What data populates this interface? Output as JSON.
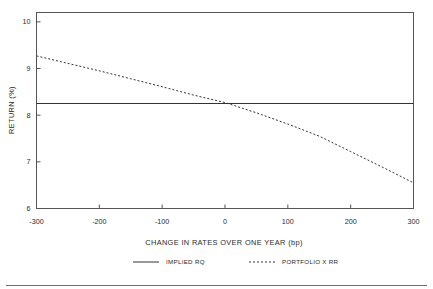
{
  "chart_data": {
    "type": "line",
    "title": "",
    "xlabel": "CHANGE IN RATES OVER ONE YEAR (bp)",
    "ylabel": "RETURN (%)",
    "xlim": [
      -300,
      300
    ],
    "ylim": [
      6,
      10.2
    ],
    "grid": false,
    "legend_position": "below-plot-center",
    "xticks": [
      -300,
      -200,
      -100,
      0,
      100,
      200,
      300
    ],
    "xtick_labels": [
      "-300",
      "-200",
      "-100",
      "0",
      "100",
      "200",
      "300"
    ],
    "yticks": [
      6,
      7,
      8,
      9,
      10
    ],
    "ytick_labels": [
      "6",
      "7",
      "8",
      "9",
      "10"
    ],
    "series": [
      {
        "name": "IMPLIED RQ",
        "style": "solid",
        "color": "#333333",
        "x": [
          -300,
          300
        ],
        "values": [
          8.25,
          8.25
        ]
      },
      {
        "name": "PORTFOLIO X RR",
        "style": "dashed",
        "color": "#333333",
        "x": [
          -300,
          -250,
          -200,
          -150,
          -100,
          -50,
          0,
          50,
          100,
          150,
          200,
          250,
          300
        ],
        "values": [
          9.27,
          9.11,
          8.95,
          8.78,
          8.61,
          8.43,
          8.27,
          8.05,
          7.81,
          7.55,
          7.22,
          6.89,
          6.55
        ]
      }
    ]
  },
  "axes": {
    "y_label": "RETURN (%)",
    "x_label": "CHANGE IN RATES OVER ONE YEAR (bp)"
  },
  "legend": {
    "entries": [
      {
        "label": "IMPLIED RQ",
        "style": "solid"
      },
      {
        "label": "PORTFOLIO X RR",
        "style": "dashed"
      }
    ]
  }
}
